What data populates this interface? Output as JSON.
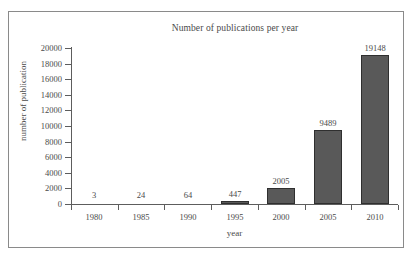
{
  "chart_data": {
    "type": "bar",
    "title": "Number of publications per year",
    "xlabel": "year",
    "ylabel": "number of publication",
    "categories": [
      "1980",
      "1985",
      "1990",
      "1995",
      "2000",
      "2005",
      "2010"
    ],
    "values": [
      3,
      24,
      64,
      447,
      2005,
      9489,
      19148
    ],
    "value_labels": [
      "3",
      "24",
      "64",
      "447",
      "2005",
      "9489",
      "19148"
    ],
    "ylim": [
      0,
      20000
    ],
    "ytick_labels": [
      "20000",
      "18000",
      "16000",
      "14000",
      "12000",
      "10000",
      "8000",
      "6000",
      "4000",
      "2000",
      "0"
    ],
    "ytick_values": [
      20000,
      18000,
      16000,
      14000,
      12000,
      10000,
      8000,
      6000,
      4000,
      2000,
      0
    ],
    "grid": false,
    "legend": false,
    "bar_color": "#595959",
    "bar_edge_color": "#2f2f2f",
    "axis_color": "#5d5d5d",
    "text_color": "#4a4a4a",
    "background": "#ffffff",
    "border_color": "#8a8a8a"
  }
}
